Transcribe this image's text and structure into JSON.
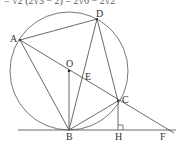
{
  "header_fragment": "= √2 (2√3 − 2) = 2√6 − 2√2",
  "diagram": {
    "points": {
      "A": {
        "label": "A",
        "x": 20,
        "y": 40
      },
      "D": {
        "label": "D",
        "x": 97,
        "y": 19
      },
      "O": {
        "label": "O",
        "x": 69,
        "y": 71
      },
      "E": {
        "label": "E",
        "x": 82,
        "y": 77
      },
      "C": {
        "label": "C",
        "x": 118,
        "y": 101
      },
      "B": {
        "label": "B",
        "x": 69,
        "y": 130
      },
      "H": {
        "label": "H",
        "x": 118,
        "y": 130
      },
      "F": {
        "label": "F",
        "x": 172,
        "y": 130
      }
    },
    "circle": {
      "center": "O",
      "radius": 59
    },
    "tangent_line": {
      "through": [
        "B",
        "H",
        "F"
      ]
    },
    "segments": [
      "AD",
      "AB",
      "AC",
      "DB",
      "DC",
      "OB",
      "BC",
      "CH",
      "AF"
    ],
    "right_angle_at": "H",
    "stroke_color": "#444444"
  }
}
